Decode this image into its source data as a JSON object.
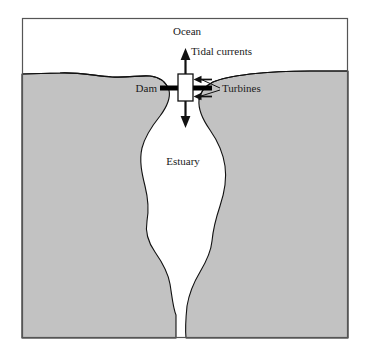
{
  "figure": {
    "frame": {
      "border_color": "#555555",
      "x": 22,
      "y": 18,
      "width": 326,
      "height": 320
    },
    "colors": {
      "land_fill": "#c2c2c2",
      "water_fill": "#ffffff",
      "outline": "#111111",
      "text": "#1a1a1a",
      "dam_color": "#000000",
      "arrow_color": "#111111"
    },
    "labels": [
      {
        "id": "ocean",
        "text": "Ocean",
        "x": 187,
        "y": 35,
        "size": 11,
        "anchor": "middle"
      },
      {
        "id": "tidal-currents",
        "text": "Tidal currents",
        "x": 191,
        "y": 55,
        "size": 11,
        "anchor": "start"
      },
      {
        "id": "dam",
        "text": "Dam",
        "x": 155,
        "y": 92,
        "size": 11,
        "anchor": "end"
      },
      {
        "id": "turbines",
        "text": "Turbines",
        "x": 222,
        "y": 92,
        "size": 11,
        "anchor": "start"
      },
      {
        "id": "estuary",
        "text": "Estuary",
        "x": 183,
        "y": 165,
        "size": 11,
        "anchor": "middle"
      }
    ],
    "regions": {
      "ocean_label": "Ocean",
      "estuary_label": "Estuary",
      "land_description": "shaded land mass surrounding estuary"
    },
    "annotations": {
      "vertical_arrow": "double-headed vertical arrow through sluice gate indicating tidal flow in and out",
      "turbine_arrows": "two left-pointing arrows indicating water driving turbines",
      "gate": "white rectangular sluice gate on dam"
    }
  }
}
